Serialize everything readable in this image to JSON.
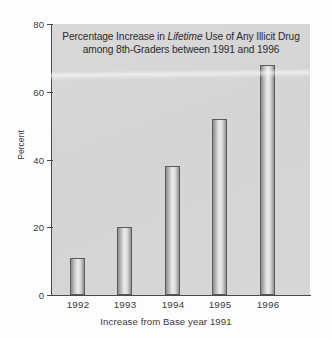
{
  "chart_data": {
    "type": "bar",
    "title_line1_pre": "Percentage Increase in ",
    "title_line1_italic": "Lifetime",
    "title_line1_post": " Use of Any Illicit Drug",
    "title_line2": "among 8th-Graders between 1991 and 1996",
    "categories": [
      "1992",
      "1993",
      "1994",
      "1995",
      "1996"
    ],
    "values": [
      11,
      20,
      38,
      52,
      68
    ],
    "xlabel": "Increase from Base year 1991",
    "ylabel": "Percent",
    "ylim": [
      0,
      80
    ],
    "yticks": [
      "0",
      "20",
      "40",
      "60",
      "80"
    ],
    "ytick_values": [
      0,
      20,
      40,
      60,
      80
    ],
    "grid": false,
    "legend": false,
    "series": [
      {
        "name": "Percentage increase in lifetime use of any illicit drug",
        "values": [
          11,
          20,
          38,
          52,
          68
        ]
      }
    ]
  },
  "colors": {
    "plot_background": "#d6d6d6",
    "page_background": "#fdfdfd",
    "axis": "#4a4a4a",
    "text": "#3a3a3a",
    "bar_outline": "#5b5b5b",
    "bar_fill_light": "#ededed",
    "bar_fill_dark": "#8d8d8d"
  }
}
